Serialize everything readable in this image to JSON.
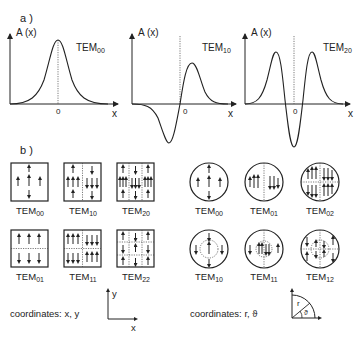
{
  "part_a": {
    "label": "a )",
    "y_axis_label": "A (x)",
    "x_axis_label": "x",
    "origin_label": "0",
    "plots": [
      {
        "mode": "TEM",
        "sub": "00"
      },
      {
        "mode": "TEM",
        "sub": "10"
      },
      {
        "mode": "TEM",
        "sub": "20"
      }
    ]
  },
  "part_b": {
    "label": "b )",
    "rect_modes": [
      {
        "mode": "TEM",
        "sub": "00"
      },
      {
        "mode": "TEM",
        "sub": "10"
      },
      {
        "mode": "TEM",
        "sub": "20"
      },
      {
        "mode": "TEM",
        "sub": "01"
      },
      {
        "mode": "TEM",
        "sub": "11"
      },
      {
        "mode": "TEM",
        "sub": "22"
      }
    ],
    "circ_modes": [
      {
        "mode": "TEM",
        "sub": "00"
      },
      {
        "mode": "TEM",
        "sub": "01"
      },
      {
        "mode": "TEM",
        "sub": "02"
      },
      {
        "mode": "TEM",
        "sub": "10"
      },
      {
        "mode": "TEM",
        "sub": "11"
      },
      {
        "mode": "TEM",
        "sub": "12"
      }
    ],
    "rect_coords": {
      "text": "coordinates: x, y",
      "x": "x",
      "y": "y"
    },
    "circ_coords": {
      "text": "coordinates: r, ϑ",
      "r": "r",
      "theta": "ϑ"
    }
  }
}
